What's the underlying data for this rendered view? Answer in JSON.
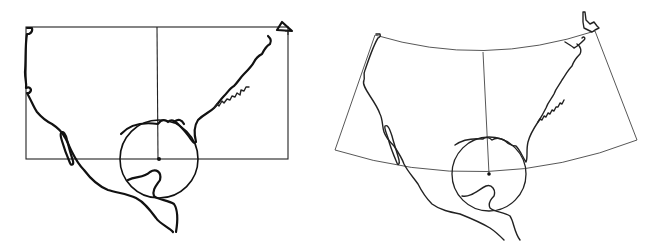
{
  "figure": {
    "panels": [
      {
        "id": "left",
        "projection_style": "rectangular (cylindrical)",
        "frame": {
          "x1": 26,
          "y1": 27,
          "x2": 288,
          "y2": 159
        },
        "central_meridian_x": 157,
        "center_point": {
          "x": 159,
          "y": 159
        },
        "tissot_circle_radius": 39,
        "stroke_color": "#111111"
      },
      {
        "id": "right",
        "projection_style": "conic (curved parallels, converging meridians)",
        "center_point": {
          "x": 489,
          "y": 174
        },
        "tissot_circle_radius": 37,
        "stroke_color": "#222222"
      }
    ],
    "background_color": "#ffffff"
  }
}
